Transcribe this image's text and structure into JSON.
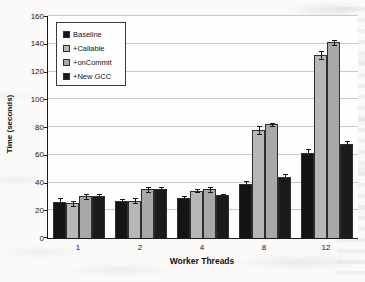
{
  "chart_data": {
    "type": "bar",
    "title": "",
    "xlabel": "Worker Threads",
    "ylabel": "Time (seconds)",
    "categories": [
      "1",
      "2",
      "4",
      "8",
      "12"
    ],
    "series": [
      {
        "name": "Baseline",
        "color": "#141414",
        "values": [
          26,
          27,
          29,
          39,
          61
        ],
        "errors": [
          3,
          1,
          1,
          2,
          3
        ]
      },
      {
        "name": "+Callable",
        "color": "#b7b7b7",
        "values": [
          25,
          27,
          34,
          78,
          132
        ],
        "errors": [
          2,
          2,
          1,
          3,
          3
        ]
      },
      {
        "name": "+onCommit",
        "color": "#a8a8a8",
        "values": [
          30,
          35,
          35,
          82,
          141
        ],
        "errors": [
          2,
          2,
          2,
          1,
          2
        ]
      },
      {
        "name": "+New GCC",
        "color": "#1b1b1b",
        "values": [
          30,
          35,
          31,
          44,
          68
        ],
        "errors": [
          2,
          2,
          1,
          2,
          2
        ]
      }
    ],
    "ylim": [
      0,
      160
    ],
    "ytick_step": 20,
    "grid": true,
    "error_bars": true,
    "legend_position": "top-left"
  }
}
